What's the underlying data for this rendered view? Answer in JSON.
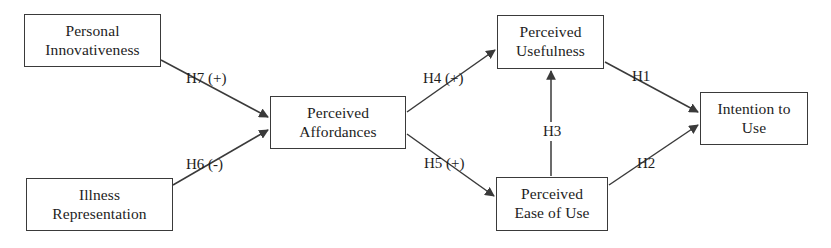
{
  "diagram": {
    "type": "path-model",
    "canvas": {
      "width": 831,
      "height": 248
    },
    "colors": {
      "background": "#ffffff",
      "box_border": "#3a3a3a",
      "text": "#1d1d1d",
      "edge": "#3a3a3a"
    },
    "nodes": [
      {
        "id": "personal-innovativeness",
        "lines": [
          "Personal",
          "Innovativeness"
        ],
        "x": 24,
        "y": 14,
        "w": 137,
        "h": 53
      },
      {
        "id": "illness-representation",
        "lines": [
          "Illness",
          "Representation"
        ],
        "x": 26,
        "y": 178,
        "w": 147,
        "h": 53
      },
      {
        "id": "perceived-affordances",
        "lines": [
          "Perceived",
          "Affordances"
        ],
        "x": 270,
        "y": 96,
        "w": 136,
        "h": 53
      },
      {
        "id": "perceived-usefulness",
        "lines": [
          "Perceived",
          "Usefulness"
        ],
        "x": 497,
        "y": 15,
        "w": 107,
        "h": 54
      },
      {
        "id": "perceived-ease-of-use",
        "lines": [
          "Perceived",
          "Ease of Use"
        ],
        "x": 496,
        "y": 177,
        "w": 112,
        "h": 54
      },
      {
        "id": "intention-to-use",
        "lines": [
          "Intention to",
          "Use"
        ],
        "x": 700,
        "y": 92,
        "w": 108,
        "h": 53
      }
    ],
    "edges": [
      {
        "id": "h7",
        "label": "H7 (+)",
        "from": "personal-innovativeness",
        "to": "perceived-affordances",
        "sign": "+",
        "label_x": 186,
        "label_y": 71
      },
      {
        "id": "h6",
        "label": "H6 (-)",
        "from": "illness-representation",
        "to": "perceived-affordances",
        "sign": "-",
        "label_x": 186,
        "label_y": 157
      },
      {
        "id": "h4",
        "label": "H4 (+)",
        "from": "perceived-affordances",
        "to": "perceived-usefulness",
        "sign": "+",
        "label_x": 423,
        "label_y": 71
      },
      {
        "id": "h5",
        "label": "H5 (+)",
        "from": "perceived-affordances",
        "to": "perceived-ease-of-use",
        "sign": "+",
        "label_x": 424,
        "label_y": 156
      },
      {
        "id": "h3",
        "label": "H3",
        "from": "perceived-ease-of-use",
        "to": "perceived-usefulness",
        "sign": "",
        "label_x": 539,
        "label_y": 122
      },
      {
        "id": "h1",
        "label": "H1",
        "from": "perceived-usefulness",
        "to": "intention-to-use",
        "sign": "",
        "label_x": 632,
        "label_y": 69
      },
      {
        "id": "h2",
        "label": "H2",
        "from": "perceived-ease-of-use",
        "to": "intention-to-use",
        "sign": "",
        "label_x": 637,
        "label_y": 156
      }
    ]
  }
}
